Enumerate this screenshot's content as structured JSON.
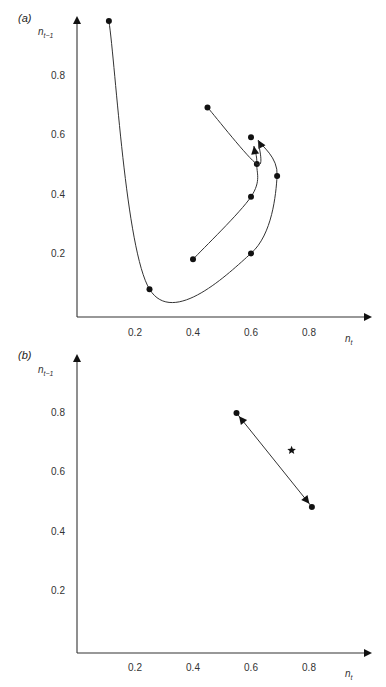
{
  "chart_data": [
    {
      "panel_label": "(a)",
      "type": "line",
      "xlabel": "n_t",
      "ylabel": "n_t-1",
      "xlabel_main": "n",
      "xlabel_sub": "t",
      "ylabel_main": "n",
      "ylabel_sub": "t−1",
      "xlim": [
        0,
        1.0
      ],
      "ylim": [
        0,
        1.0
      ],
      "xticks": [
        "0.2",
        "0.4",
        "0.6",
        "0.8"
      ],
      "xtick_values": [
        0.2,
        0.4,
        0.6,
        0.8
      ],
      "yticks": [
        "0.2",
        "0.4",
        "0.6",
        "0.8"
      ],
      "ytick_values": [
        0.2,
        0.4,
        0.6,
        0.8
      ],
      "grid": false,
      "series": [
        {
          "name": "trajectory-1",
          "points": [
            [
              0.11,
              0.98
            ],
            [
              0.25,
              0.08
            ],
            [
              0.6,
              0.2
            ],
            [
              0.69,
              0.46
            ],
            [
              0.625,
              0.58
            ]
          ],
          "markers": [
            [
              0.11,
              0.98
            ],
            [
              0.25,
              0.08
            ],
            [
              0.6,
              0.2
            ],
            [
              0.69,
              0.46
            ]
          ],
          "arrow_end": true
        },
        {
          "name": "trajectory-2",
          "points": [
            [
              0.4,
              0.18
            ],
            [
              0.6,
              0.39
            ],
            [
              0.62,
              0.5
            ],
            [
              0.61,
              0.56
            ]
          ],
          "markers": [
            [
              0.4,
              0.18
            ],
            [
              0.6,
              0.39
            ],
            [
              0.62,
              0.5
            ]
          ],
          "arrow_end": true
        },
        {
          "name": "trajectory-3",
          "points": [
            [
              0.45,
              0.69
            ],
            [
              0.62,
              0.5
            ],
            [
              0.625,
              0.58
            ]
          ],
          "markers": [
            [
              0.45,
              0.69
            ],
            [
              0.6,
              0.59
            ]
          ],
          "arrow_end": false
        }
      ]
    },
    {
      "panel_label": "(b)",
      "type": "line",
      "xlabel": "n_t",
      "ylabel": "n_t-1",
      "xlabel_main": "n",
      "xlabel_sub": "t",
      "ylabel_main": "n",
      "ylabel_sub": "t−1",
      "xlim": [
        0,
        1.0
      ],
      "ylim": [
        0,
        1.0
      ],
      "xticks": [
        "0.2",
        "0.4",
        "0.6",
        "0.8"
      ],
      "xtick_values": [
        0.2,
        0.4,
        0.6,
        0.8
      ],
      "yticks": [
        "0.2",
        "0.4",
        "0.6",
        "0.8"
      ],
      "ytick_values": [
        0.2,
        0.4,
        0.6,
        0.8
      ],
      "grid": false,
      "series": [
        {
          "name": "two-cycle",
          "points": [
            [
              0.55,
              0.795
            ],
            [
              0.81,
              0.48
            ]
          ],
          "markers": [
            [
              0.55,
              0.795
            ],
            [
              0.81,
              0.48
            ]
          ],
          "arrows_both_ends": true
        }
      ],
      "annotations": [
        {
          "type": "star",
          "label": "equilibrium",
          "x": 0.74,
          "y": 0.67
        }
      ]
    }
  ]
}
